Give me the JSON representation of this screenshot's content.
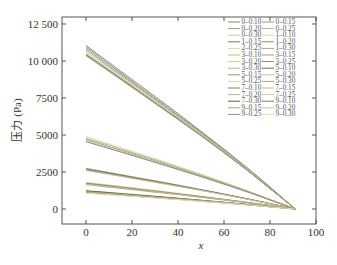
{
  "chart_data": {
    "type": "line",
    "title": "",
    "xlabel": "x",
    "ylabel": "压力 (Pa)",
    "xlim": [
      0,
      100
    ],
    "ylim": [
      -700,
      13000
    ],
    "x_ticks": [
      0,
      20,
      40,
      60,
      80,
      100
    ],
    "y_ticks": [
      0,
      2500,
      5000,
      7500,
      10000,
      12500
    ],
    "y_tick_labels": [
      "0",
      "2500",
      "5000",
      "7500",
      "10 000",
      "12 500"
    ],
    "x_tick_labels": [
      "0",
      "20",
      "40",
      "60",
      "80",
      "100"
    ],
    "grid": false,
    "legend_position": "upper right (2 columns)",
    "x": [
      0,
      10,
      20,
      30,
      40,
      50,
      60,
      70,
      80,
      91
    ],
    "series": [
      {
        "name": "0–0.10",
        "color": "#8a8a7a",
        "values": [
          11050,
          9900,
          8750,
          7600,
          6450,
          5250,
          4050,
          2800,
          1500,
          0
        ]
      },
      {
        "name": "0–0.15",
        "color": "#9a9a8a",
        "values": [
          10950,
          9800,
          8650,
          7500,
          6350,
          5200,
          4000,
          2750,
          1450,
          0
        ]
      },
      {
        "name": "0–0.20",
        "color": "#a0a090",
        "values": [
          10850,
          9700,
          8570,
          7430,
          6300,
          5150,
          3950,
          2720,
          1430,
          0
        ]
      },
      {
        "name": "0–0.25",
        "color": "#b0b098",
        "values": [
          10750,
          9620,
          8500,
          7370,
          6250,
          5100,
          3920,
          2700,
          1420,
          0
        ]
      },
      {
        "name": "0–0.30",
        "color": "#c8c8a8",
        "values": [
          10650,
          9540,
          8430,
          7310,
          6200,
          5060,
          3890,
          2680,
          1410,
          0
        ]
      },
      {
        "name": "1–0.10",
        "color": "#d8d8b0",
        "values": [
          10550,
          9460,
          8360,
          7250,
          6150,
          5020,
          3860,
          2660,
          1400,
          0
        ]
      },
      {
        "name": "1–0.15",
        "color": "#7a7a6a",
        "values": [
          10450,
          9380,
          8290,
          7190,
          6100,
          4980,
          3830,
          2640,
          1390,
          0
        ]
      },
      {
        "name": "1–0.20",
        "color": "#8c8c70",
        "values": [
          10400,
          9330,
          8250,
          7160,
          6070,
          4960,
          3810,
          2630,
          1380,
          0
        ]
      },
      {
        "name": "1–0.30",
        "color": "#a8a888",
        "values": [
          10350,
          9290,
          8210,
          7130,
          6040,
          4940,
          3800,
          2620,
          1375,
          0
        ]
      },
      {
        "name": "2–0.25",
        "color": "#e0d8a0",
        "values": [
          4900,
          4400,
          3900,
          3400,
          2880,
          2350,
          1810,
          1250,
          660,
          0
        ]
      },
      {
        "name": "3–0.10",
        "color": "#bcbca0",
        "values": [
          4800,
          4310,
          3820,
          3330,
          2820,
          2300,
          1770,
          1220,
          645,
          0
        ]
      },
      {
        "name": "3–0.15",
        "color": "#9c9c84",
        "values": [
          4700,
          4220,
          3740,
          3260,
          2760,
          2250,
          1730,
          1195,
          630,
          0
        ]
      },
      {
        "name": "3–0.20",
        "color": "#d0cca0",
        "values": [
          4620,
          4150,
          3680,
          3200,
          2710,
          2210,
          1700,
          1175,
          620,
          0
        ]
      },
      {
        "name": "3–0.25",
        "color": "#8a8a78",
        "values": [
          4550,
          4090,
          3620,
          3150,
          2670,
          2180,
          1680,
          1160,
          610,
          0
        ]
      },
      {
        "name": "3–0.30",
        "color": "#b4b494",
        "values": [
          2750,
          2470,
          2190,
          1910,
          1620,
          1320,
          1020,
          700,
          370,
          0
        ]
      },
      {
        "name": "5–0.10",
        "color": "#6a6a5c",
        "values": [
          2700,
          2430,
          2150,
          1870,
          1590,
          1300,
          1000,
          690,
          365,
          0
        ]
      },
      {
        "name": "5–0.15",
        "color": "#94947c",
        "values": [
          2650,
          2380,
          2110,
          1840,
          1560,
          1275,
          980,
          675,
          355,
          0
        ]
      },
      {
        "name": "5–0.20",
        "color": "#c4c09c",
        "values": [
          2600,
          2340,
          2070,
          1800,
          1530,
          1250,
          960,
          665,
          350,
          0
        ]
      },
      {
        "name": "5–0.25",
        "color": "#dcd4a0",
        "values": [
          1800,
          1620,
          1440,
          1250,
          1060,
          865,
          665,
          460,
          240,
          0
        ]
      },
      {
        "name": "5–0.30",
        "color": "#a4a48c",
        "values": [
          1760,
          1580,
          1400,
          1220,
          1035,
          845,
          650,
          450,
          235,
          0
        ]
      },
      {
        "name": "7–0.10",
        "color": "#848470",
        "values": [
          1720,
          1545,
          1370,
          1190,
          1010,
          825,
          635,
          440,
          230,
          0
        ]
      },
      {
        "name": "7–0.15",
        "color": "#c0bc98",
        "values": [
          1680,
          1510,
          1340,
          1165,
          990,
          805,
          620,
          430,
          225,
          0
        ]
      },
      {
        "name": "7–0.20",
        "color": "#b8b490",
        "values": [
          1640,
          1475,
          1305,
          1135,
          965,
          785,
          605,
          420,
          220,
          0
        ]
      },
      {
        "name": "7–0.25",
        "color": "#d4cc98",
        "values": [
          1250,
          1125,
          1000,
          870,
          740,
          600,
          462,
          320,
          168,
          0
        ]
      },
      {
        "name": "7–0.30",
        "color": "#5c5c50",
        "values": [
          1220,
          1098,
          975,
          850,
          722,
          588,
          452,
          312,
          164,
          0
        ]
      },
      {
        "name": "9–0.10",
        "color": "#7c7c68",
        "values": [
          1190,
          1070,
          950,
          828,
          704,
          573,
          441,
          305,
          160,
          0
        ]
      },
      {
        "name": "9–0.15",
        "color": "#a8a488",
        "values": [
          1160,
          1044,
          927,
          807,
          686,
          559,
          430,
          297,
          156,
          0
        ]
      },
      {
        "name": "9–0.20",
        "color": "#c8c49c",
        "values": [
          1130,
          1017,
          903,
          786,
          668,
          544,
          419,
          289,
          152,
          0
        ]
      },
      {
        "name": "9–0.25",
        "color": "#909078",
        "values": [
          1100,
          990,
          879,
          765,
          650,
          530,
          408,
          282,
          148,
          0
        ]
      },
      {
        "name": "9–0.30",
        "color": "#e4dca8",
        "values": [
          1070,
          963,
          855,
          745,
          632,
          515,
          397,
          274,
          144,
          0
        ]
      }
    ]
  },
  "legend": {
    "left_column": [
      "0–0.10",
      "0–0.20",
      "0–0.30",
      "1–0.15",
      "2–0.25",
      "3–0.10",
      "3–0.20",
      "3–0.30",
      "5–0.15",
      "5–0.25",
      "7–0.10",
      "7–0.20",
      "7–0.30",
      "9–0.15",
      "9–0.25"
    ],
    "right_column": [
      "0–0.15",
      "0–0.25",
      "1–0.10",
      "1–0.20",
      "1–0.30",
      "3–0.15",
      "3–0.25",
      "5–0.10",
      "5–0.20",
      "5–0.30",
      "7–0.15",
      "7–0.25",
      "9–0.10",
      "9–0.20",
      "9–0.30"
    ],
    "left_colors": [
      "#8a8a7a",
      "#a0a090",
      "#c8c8a8",
      "#7a7a6a",
      "#e0d8a0",
      "#bcbca0",
      "#d0cca0",
      "#b4b494",
      "#94947c",
      "#dcd4a0",
      "#848470",
      "#b8b490",
      "#5c5c50",
      "#a8a488",
      "#909078"
    ],
    "right_colors": [
      "#9a9a8a",
      "#b0b098",
      "#d8d8b0",
      "#8c8c70",
      "#a8a888",
      "#9c9c84",
      "#8a8a78",
      "#6a6a5c",
      "#c4c09c",
      "#a4a48c",
      "#c0bc98",
      "#d4cc98",
      "#7c7c68",
      "#c8c49c",
      "#e4dca8"
    ]
  },
  "plot": {
    "frame_color": "#444444",
    "background": "#ffffff"
  }
}
